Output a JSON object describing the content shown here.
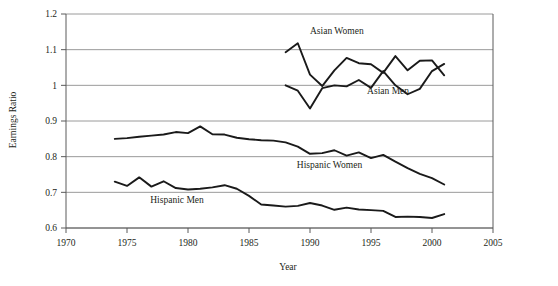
{
  "chart_data": {
    "type": "line",
    "title": "",
    "xlabel": "Year",
    "ylabel": "Earnings Ratio",
    "xlim": [
      1970,
      2005
    ],
    "ylim": [
      0.6,
      1.2
    ],
    "xticks": [
      1970,
      1975,
      1980,
      1985,
      1990,
      1995,
      2000,
      2005
    ],
    "xtick_labels": [
      "1970",
      "1975",
      "1980",
      "1985",
      "1990",
      "1995",
      "2000",
      "2005"
    ],
    "yticks": [
      0.6,
      0.7,
      0.8,
      0.9,
      1.0,
      1.1,
      1.2
    ],
    "ytick_labels": [
      "0.6",
      "0.7",
      "0.8",
      "0.9",
      "1",
      "1.1",
      "1.2"
    ],
    "grid": "horizontal",
    "legend_position": "inline-annotations",
    "line_color": "#1a1a1a",
    "grid_color": "#9a9a9a",
    "axis_color": "#5a5a5a",
    "series": [
      {
        "name": "Asian Women",
        "label": "Asian Women",
        "label_x": 1992.2,
        "label_y": 1.145,
        "x": [
          1988,
          1989,
          1990,
          1991,
          1992,
          1993,
          1994,
          1995,
          1996,
          1997,
          1998,
          1999,
          2000,
          2001
        ],
        "values": [
          1.093,
          1.118,
          1.03,
          0.998,
          1.042,
          1.077,
          1.062,
          1.059,
          1.035,
          1.082,
          1.042,
          1.069,
          1.07,
          1.028
        ]
      },
      {
        "name": "Asian Men",
        "label": "Asian Men",
        "label_x": 1996.4,
        "label_y": 0.975,
        "x": [
          1988,
          1989,
          1990,
          1991,
          1992,
          1993,
          1994,
          1995,
          1996,
          1997,
          1998,
          1999,
          2000,
          2001
        ],
        "values": [
          1.0,
          0.985,
          0.935,
          0.992,
          1.0,
          0.997,
          1.015,
          0.993,
          1.04,
          1.0,
          0.975,
          0.99,
          1.04,
          1.06
        ]
      },
      {
        "name": "Hispanic Women",
        "label": "Hispanic Women",
        "label_x": 1991.6,
        "label_y": 0.768,
        "x": [
          1974,
          1975,
          1976,
          1977,
          1978,
          1979,
          1980,
          1981,
          1982,
          1983,
          1984,
          1985,
          1986,
          1987,
          1988,
          1989,
          1990,
          1991,
          1992,
          1993,
          1994,
          1995,
          1996,
          1997,
          1998,
          1999,
          2000,
          2001
        ],
        "values": [
          0.85,
          0.852,
          0.856,
          0.859,
          0.862,
          0.869,
          0.866,
          0.885,
          0.863,
          0.862,
          0.853,
          0.849,
          0.846,
          0.845,
          0.84,
          0.828,
          0.808,
          0.81,
          0.818,
          0.803,
          0.812,
          0.796,
          0.805,
          0.786,
          0.768,
          0.752,
          0.74,
          0.722
        ]
      },
      {
        "name": "Hispanic Men",
        "label": "Hispanic Men",
        "label_x": 1979.1,
        "label_y": 0.67,
        "x": [
          1974,
          1975,
          1976,
          1977,
          1978,
          1979,
          1980,
          1981,
          1982,
          1983,
          1984,
          1985,
          1986,
          1987,
          1988,
          1989,
          1990,
          1991,
          1992,
          1993,
          1994,
          1995,
          1996,
          1997,
          1998,
          1999,
          2000,
          2001
        ],
        "values": [
          0.73,
          0.718,
          0.742,
          0.716,
          0.731,
          0.712,
          0.708,
          0.71,
          0.714,
          0.72,
          0.71,
          0.69,
          0.666,
          0.663,
          0.66,
          0.662,
          0.67,
          0.663,
          0.651,
          0.657,
          0.652,
          0.65,
          0.648,
          0.631,
          0.632,
          0.631,
          0.628,
          0.639
        ]
      }
    ]
  }
}
